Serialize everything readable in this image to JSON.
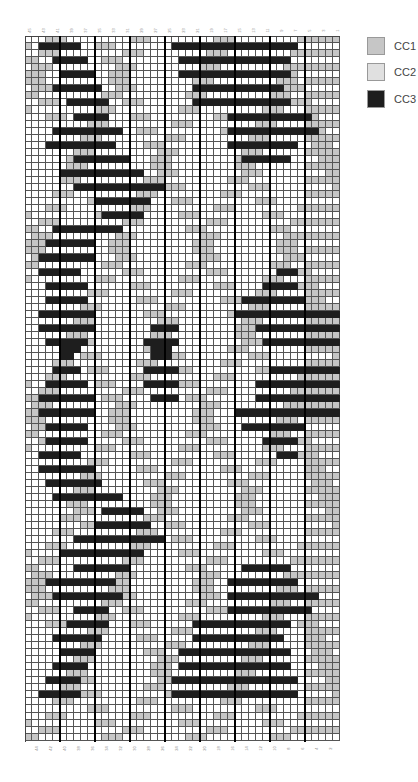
{
  "chart_data": {
    "type": "heatmap",
    "title": "",
    "columns": 45,
    "rows": 100,
    "top_labels": [
      "45",
      "43",
      "41",
      "39",
      "37",
      "35",
      "33",
      "31",
      "29",
      "27",
      "25",
      "23",
      "21",
      "19",
      "17",
      "15",
      "13",
      "11",
      "9",
      "7",
      "5",
      "3",
      "1"
    ],
    "bottom_labels": [
      "44",
      "42",
      "40",
      "38",
      "36",
      "34",
      "32",
      "30",
      "28",
      "26",
      "24",
      "22",
      "20",
      "18",
      "16",
      "14",
      "12",
      "10",
      "8",
      "6",
      "4",
      "2"
    ],
    "thick_line_every": 5,
    "legend": [
      {
        "key": "c1",
        "label": "CC1",
        "color": "#c6c6c6"
      },
      {
        "key": "c2",
        "label": "CC2",
        "color": "#dedede"
      },
      {
        "key": "c3",
        "label": "CC3",
        "color": "#1e1e1e"
      }
    ],
    "cc3_runs": [
      [],
      [
        [
          2,
          7
        ],
        [
          21,
          38
        ]
      ],
      [],
      [
        [
          4,
          8
        ],
        [
          22,
          37
        ]
      ],
      [],
      [
        [
          5,
          9
        ],
        [
          22,
          37
        ]
      ],
      [],
      [
        [
          4,
          10
        ],
        [
          24,
          36
        ]
      ],
      [],
      [
        [
          6,
          11
        ],
        [
          24,
          37
        ]
      ],
      [],
      [
        [
          7,
          11
        ],
        [
          29,
          40
        ]
      ],
      [],
      [
        [
          4,
          13
        ],
        [
          29,
          41
        ]
      ],
      [],
      [
        [
          3,
          12
        ],
        [
          29,
          38
        ]
      ],
      [],
      [
        [
          7,
          14
        ],
        [
          31,
          37
        ]
      ],
      [],
      [
        [
          5,
          16
        ]
      ],
      [],
      [
        [
          7,
          19
        ]
      ],
      [],
      [
        [
          10,
          17
        ]
      ],
      [],
      [
        [
          11,
          16
        ]
      ],
      [],
      [
        [
          4,
          13
        ]
      ],
      [],
      [
        [
          3,
          9
        ]
      ],
      [],
      [
        [
          2,
          9
        ]
      ],
      [],
      [
        [
          2,
          7
        ],
        [
          36,
          38
        ]
      ],
      [],
      [
        [
          3,
          8
        ],
        [
          34,
          38
        ]
      ],
      [],
      [
        [
          3,
          8
        ],
        [
          31,
          39
        ]
      ],
      [],
      [
        [
          2,
          9
        ],
        [
          30,
          44
        ]
      ],
      [],
      [
        [
          2,
          9
        ],
        [
          18,
          21
        ],
        [
          33,
          44
        ]
      ],
      [],
      [
        [
          3,
          8
        ],
        [
          17,
          21
        ],
        [
          34,
          44
        ]
      ],
      [
        [
          5,
          7
        ],
        [
          18,
          20
        ]
      ],
      [
        [
          5,
          6
        ],
        [
          18,
          20
        ]
      ],
      [],
      [
        [
          4,
          7
        ],
        [
          17,
          21
        ],
        [
          35,
          44
        ]
      ],
      [],
      [
        [
          3,
          8
        ],
        [
          17,
          21
        ],
        [
          33,
          44
        ]
      ],
      [],
      [
        [
          2,
          9
        ],
        [
          18,
          21
        ],
        [
          33,
          44
        ]
      ],
      [],
      [
        [
          2,
          9
        ],
        [
          30,
          44
        ]
      ],
      [],
      [
        [
          3,
          8
        ],
        [
          31,
          39
        ]
      ],
      [],
      [
        [
          3,
          8
        ],
        [
          34,
          38
        ]
      ],
      [],
      [
        [
          2,
          7
        ],
        [
          36,
          38
        ]
      ],
      [],
      [
        [
          2,
          9
        ]
      ],
      [],
      [
        [
          3,
          10
        ]
      ],
      [],
      [
        [
          4,
          13
        ]
      ],
      [],
      [
        [
          11,
          16
        ]
      ],
      [],
      [
        [
          10,
          17
        ]
      ],
      [],
      [
        [
          7,
          19
        ]
      ],
      [],
      [
        [
          5,
          16
        ]
      ],
      [],
      [
        [
          7,
          14
        ],
        [
          31,
          37
        ]
      ],
      [],
      [
        [
          3,
          12
        ],
        [
          29,
          38
        ]
      ],
      [],
      [
        [
          4,
          13
        ],
        [
          29,
          41
        ]
      ],
      [],
      [
        [
          7,
          11
        ],
        [
          29,
          40
        ]
      ],
      [],
      [
        [
          6,
          11
        ],
        [
          24,
          37
        ]
      ],
      [],
      [
        [
          4,
          10
        ],
        [
          24,
          36
        ]
      ],
      [],
      [
        [
          5,
          9
        ],
        [
          22,
          37
        ]
      ],
      [],
      [
        [
          4,
          8
        ],
        [
          22,
          37
        ]
      ],
      [],
      [
        [
          3,
          7
        ],
        [
          21,
          38
        ]
      ],
      [],
      [
        [
          2,
          7
        ],
        [
          21,
          38
        ]
      ],
      [],
      [],
      [],
      [],
      [],
      []
    ],
    "cc1_bands": "alternating gray columns in groups of 2-3 forming diagonal stripe background"
  },
  "legend": {
    "cc1": "CC1",
    "cc2": "CC2",
    "cc3": "CC3"
  }
}
